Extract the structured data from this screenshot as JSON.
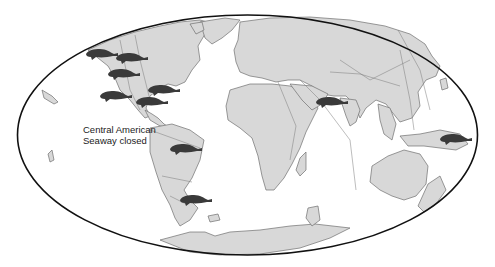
{
  "figure": {
    "projection": "Mollweide world map",
    "colors": {
      "land": "#d8d8d8",
      "coastline": "#707070",
      "border": "#111111",
      "seacow": "#3a3a3a",
      "ocean": "#ffffff"
    }
  },
  "annotation": {
    "line1": "Central American",
    "line2": "Seaway closed"
  },
  "markers": [
    {
      "icon": "seacow-icon",
      "region": "north-pacific-alaska",
      "x": 98,
      "y": 54
    },
    {
      "icon": "seacow-icon",
      "region": "northwest-north-america-coast",
      "x": 128,
      "y": 58
    },
    {
      "icon": "seacow-icon",
      "region": "west-coast-north-america",
      "x": 120,
      "y": 74
    },
    {
      "icon": "seacow-icon",
      "region": "baja-california",
      "x": 112,
      "y": 96
    },
    {
      "icon": "seacow-icon",
      "region": "gulf-of-mexico",
      "x": 160,
      "y": 92
    },
    {
      "icon": "seacow-icon",
      "region": "caribbean",
      "x": 150,
      "y": 102
    },
    {
      "icon": "seacow-icon",
      "region": "amazon-basin",
      "x": 182,
      "y": 149
    },
    {
      "icon": "seacow-icon",
      "region": "southern-south-america",
      "x": 192,
      "y": 200
    },
    {
      "icon": "seacow-icon",
      "region": "arabian-sea",
      "x": 328,
      "y": 102
    },
    {
      "icon": "seacow-icon",
      "region": "new-guinea-western-pacific",
      "x": 452,
      "y": 139
    }
  ]
}
